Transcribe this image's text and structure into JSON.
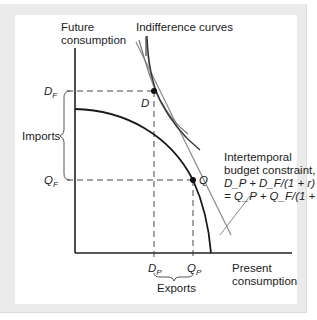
{
  "diagram": {
    "y_axis_label_line1": "Future",
    "y_axis_label_line2": "consumption",
    "x_axis_label_line1": "Present",
    "x_axis_label_line2": "consumption",
    "indifference_label": "Indifference curves",
    "budget_label_line1": "Intertemporal",
    "budget_label_line2": "budget constraint,",
    "budget_label_line3": "D_P + D_F/(1 + r)",
    "budget_label_line4": "= Q_P + Q_F/(1 + r)",
    "point_D": "D",
    "point_Q": "Q",
    "tick_DF": "D",
    "tick_DF_sub": "F",
    "tick_QF": "Q",
    "tick_QF_sub": "F",
    "tick_DP": "D",
    "tick_DP_sub": "P",
    "tick_QP": "Q",
    "tick_QP_sub": "P",
    "imports_label": "Imports",
    "exports_label": "Exports"
  },
  "colors": {
    "frame_bg": "#ebebeb",
    "axis": "#222222",
    "ppf": "#1a1a1a",
    "indifference": "#555555",
    "budget_line": "#888888",
    "dashed": "#333333"
  }
}
